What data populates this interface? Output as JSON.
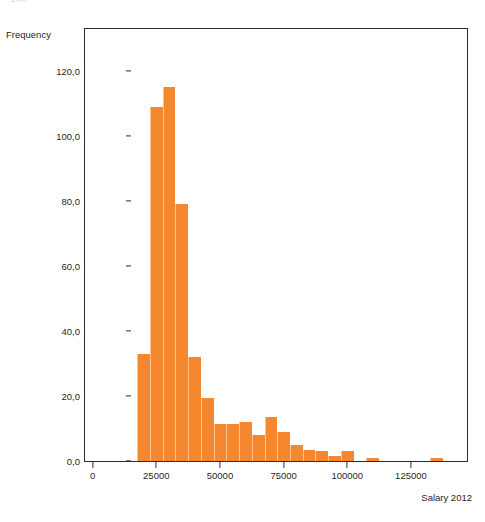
{
  "page_artifact": "240",
  "chart_data": {
    "type": "bar",
    "title": "",
    "subtitle": "",
    "xlabel": "Salary 2012",
    "ylabel": "Frequency",
    "grid": false,
    "legend": null,
    "bar_color": "#F5872E",
    "axis_color": "#2b2b2b",
    "xlim": [
      -3000,
      147000
    ],
    "ylim": [
      0,
      133
    ],
    "bin_width": 5000,
    "x_tick_labels": [
      "0",
      "25000",
      "50000",
      "75000",
      "100000",
      "125000"
    ],
    "x_tick_values": [
      0,
      25000,
      50000,
      75000,
      100000,
      125000
    ],
    "y_tick_labels": [
      "0,0",
      "20,0",
      "40,0",
      "60,0",
      "80,0",
      "100,0",
      "120,0"
    ],
    "y_tick_values": [
      0,
      20,
      40,
      60,
      80,
      100,
      120
    ],
    "bins": [
      {
        "start": 17500,
        "end": 22500,
        "center": 20000,
        "value": 33
      },
      {
        "start": 22500,
        "end": 27500,
        "center": 25000,
        "value": 109
      },
      {
        "start": 27500,
        "end": 32500,
        "center": 30000,
        "value": 115
      },
      {
        "start": 32500,
        "end": 37500,
        "center": 35000,
        "value": 79
      },
      {
        "start": 37500,
        "end": 42500,
        "center": 40000,
        "value": 32
      },
      {
        "start": 42500,
        "end": 47500,
        "center": 45000,
        "value": 19.5
      },
      {
        "start": 47500,
        "end": 52500,
        "center": 50000,
        "value": 11.5
      },
      {
        "start": 52500,
        "end": 57500,
        "center": 55000,
        "value": 11.5
      },
      {
        "start": 57500,
        "end": 62500,
        "center": 60000,
        "value": 12
      },
      {
        "start": 62500,
        "end": 67500,
        "center": 65000,
        "value": 8
      },
      {
        "start": 67500,
        "end": 72500,
        "center": 70000,
        "value": 13.5
      },
      {
        "start": 72500,
        "end": 77500,
        "center": 75000,
        "value": 9
      },
      {
        "start": 77500,
        "end": 82500,
        "center": 80000,
        "value": 5
      },
      {
        "start": 82500,
        "end": 87500,
        "center": 85000,
        "value": 3.5
      },
      {
        "start": 87500,
        "end": 92500,
        "center": 90000,
        "value": 3
      },
      {
        "start": 92500,
        "end": 97500,
        "center": 95000,
        "value": 1.5
      },
      {
        "start": 97500,
        "end": 102500,
        "center": 100000,
        "value": 3
      },
      {
        "start": 102500,
        "end": 107500,
        "center": 105000,
        "value": 0
      },
      {
        "start": 107500,
        "end": 112500,
        "center": 110000,
        "value": 1
      },
      {
        "start": 112500,
        "end": 117500,
        "center": 115000,
        "value": 0
      },
      {
        "start": 117500,
        "end": 122500,
        "center": 120000,
        "value": 0
      },
      {
        "start": 122500,
        "end": 127500,
        "center": 125000,
        "value": 0
      },
      {
        "start": 127500,
        "end": 132500,
        "center": 130000,
        "value": 0
      },
      {
        "start": 132500,
        "end": 137500,
        "center": 135000,
        "value": 0.8
      }
    ]
  }
}
